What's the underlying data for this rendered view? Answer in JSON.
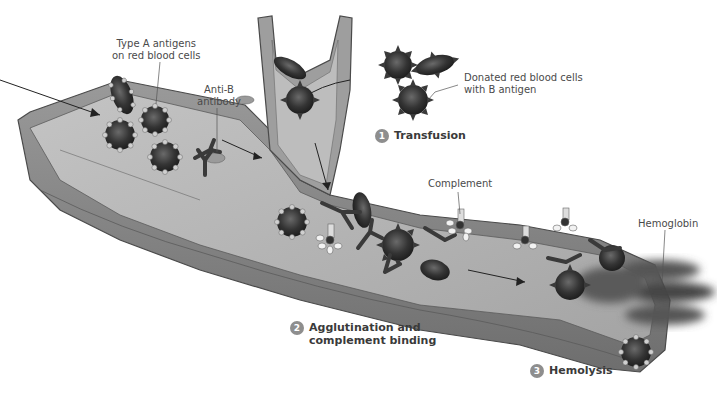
{
  "figure": {
    "palette": {
      "vessel_wall": "#8a8a8a",
      "vessel_lumen": "#b9b9b9",
      "vessel_dark": "#5a5a5a",
      "cell_dark": "#2e2e2e",
      "antigen_light": "#d6d6d6",
      "label_text": "#4a4a4a",
      "step_text": "#3a3a3a",
      "badge_fill": "#8e8e8e"
    }
  },
  "labels": {
    "type_a_antigens": "Type A antigens\non red blood cells",
    "type_a_line1": "Type A antigens",
    "type_a_line2": "on red blood cells",
    "anti_b_line1": "Anti-B",
    "anti_b_line2": "antibody",
    "donated_line1": "Donated red blood cells",
    "donated_line2": "with B antigen",
    "complement": "Complement",
    "hemoglobin": "Hemoglobin"
  },
  "steps": [
    {
      "number": "1",
      "line1": "Transfusion",
      "line2": ""
    },
    {
      "number": "2",
      "line1": "Agglutination and",
      "line2": "complement binding"
    },
    {
      "number": "3",
      "line1": "Hemolysis",
      "line2": ""
    }
  ]
}
